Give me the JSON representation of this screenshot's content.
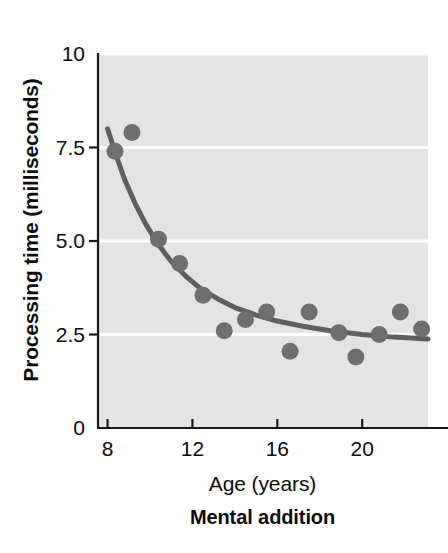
{
  "chart_data": {
    "type": "scatter",
    "title": "",
    "subtitle": "Mental addition",
    "xlabel": "Age (years)",
    "ylabel": "Processing time (milliseconds)",
    "xlim": [
      7.55,
      23.1
    ],
    "ylim": [
      0,
      10
    ],
    "xticks": [
      8,
      12,
      16,
      20
    ],
    "xtick_labels": [
      "8",
      "12",
      "16",
      "20"
    ],
    "yticks": [
      0,
      2.5,
      5.0,
      7.5,
      10
    ],
    "ytick_labels": [
      "0",
      "2.5",
      "5.0",
      "7.5",
      "10"
    ],
    "grid": "horizontal-white",
    "legend": "none",
    "x": [
      8.35,
      9.15,
      10.4,
      11.4,
      12.5,
      13.5,
      14.5,
      15.5,
      16.6,
      17.5,
      18.9,
      19.7,
      20.8,
      21.8,
      22.8
    ],
    "y": [
      7.4,
      7.9,
      5.05,
      4.4,
      3.55,
      2.6,
      2.9,
      3.1,
      2.05,
      3.1,
      2.55,
      1.9,
      2.5,
      3.1,
      2.65
    ],
    "points": [
      {
        "age": 8.35,
        "processing_time": 7.4
      },
      {
        "age": 9.15,
        "processing_time": 7.9
      },
      {
        "age": 10.4,
        "processing_time": 5.05
      },
      {
        "age": 11.4,
        "processing_time": 4.4
      },
      {
        "age": 12.5,
        "processing_time": 3.55
      },
      {
        "age": 13.5,
        "processing_time": 2.6
      },
      {
        "age": 14.5,
        "processing_time": 2.9
      },
      {
        "age": 15.5,
        "processing_time": 3.1
      },
      {
        "age": 16.6,
        "processing_time": 2.05
      },
      {
        "age": 17.5,
        "processing_time": 3.1
      },
      {
        "age": 18.9,
        "processing_time": 2.55
      },
      {
        "age": 19.7,
        "processing_time": 1.9
      },
      {
        "age": 20.8,
        "processing_time": 2.5
      },
      {
        "age": 21.8,
        "processing_time": 3.1
      },
      {
        "age": 22.8,
        "processing_time": 2.65
      }
    ],
    "fit_curve": {
      "name": "exponential decay fit",
      "x": [
        8.0,
        8.4,
        8.8,
        9.3,
        9.8,
        10.4,
        11.0,
        11.7,
        12.4,
        13.2,
        14.0,
        15.0,
        16.0,
        17.2,
        18.5,
        20.0,
        21.5,
        23.1
      ],
      "y": [
        8.0,
        7.3,
        6.65,
        6.0,
        5.45,
        4.9,
        4.45,
        4.05,
        3.72,
        3.45,
        3.22,
        3.02,
        2.86,
        2.72,
        2.6,
        2.5,
        2.43,
        2.38
      ]
    },
    "colors": {
      "plot_background": "#e4e4e4",
      "gridline": "#fdfdfd",
      "axis": "#1a1a1a",
      "marker": "#6e6e6e",
      "curve": "#5f5f5f",
      "text": "#0b0b0b",
      "page_background": "#ffffff"
    }
  }
}
